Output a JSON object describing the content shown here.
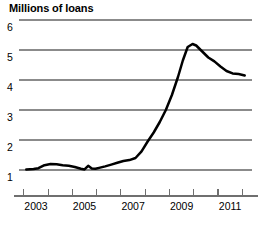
{
  "chart_data": {
    "type": "line",
    "title": "Millions of loans",
    "xlabel": "",
    "ylabel": "Millions of loans",
    "ylim": [
      0.4,
      6.2
    ],
    "xlim": [
      2002.3,
      2011.9
    ],
    "grid": true,
    "legend": "none",
    "y_ticks": [
      6,
      5,
      4,
      3,
      2,
      1
    ],
    "y_tick_labels": [
      "6",
      "5",
      "4",
      "3",
      "2",
      "1"
    ],
    "x_ticks": [
      2002.5,
      2003.5,
      2004.5,
      2005.5,
      2006.5,
      2007.5,
      2008.5,
      2009.5,
      2010.5,
      2011.5
    ],
    "x_tick_labels": [
      "2003",
      "2005",
      "2007",
      "2009",
      "2011"
    ],
    "x_tick_label_values": [
      2003,
      2005,
      2007,
      2009,
      2011
    ],
    "line_color": "#000000",
    "grid_color": "#8b8b8b",
    "series": [
      {
        "name": "Loans",
        "x": [
          2002.6,
          2002.9,
          2003.1,
          2003.35,
          2003.6,
          2003.85,
          2004.1,
          2004.35,
          2004.6,
          2004.85,
          2005.0,
          2005.15,
          2005.3,
          2005.45,
          2005.6,
          2005.85,
          2006.1,
          2006.35,
          2006.6,
          2006.85,
          2007.1,
          2007.35,
          2007.6,
          2007.85,
          2008.1,
          2008.35,
          2008.6,
          2008.85,
          2009.05,
          2009.25,
          2009.45,
          2009.6,
          2009.85,
          2010.1,
          2010.35,
          2010.6,
          2010.85,
          2011.1,
          2011.35,
          2011.6
        ],
        "y": [
          1.02,
          1.03,
          1.06,
          1.16,
          1.2,
          1.19,
          1.16,
          1.14,
          1.1,
          1.04,
          1.02,
          1.14,
          1.05,
          1.04,
          1.07,
          1.12,
          1.18,
          1.24,
          1.3,
          1.33,
          1.4,
          1.62,
          1.95,
          2.25,
          2.6,
          3.0,
          3.5,
          4.1,
          4.65,
          5.1,
          5.2,
          5.15,
          4.95,
          4.75,
          4.62,
          4.45,
          4.3,
          4.22,
          4.2,
          4.15
        ]
      }
    ]
  }
}
